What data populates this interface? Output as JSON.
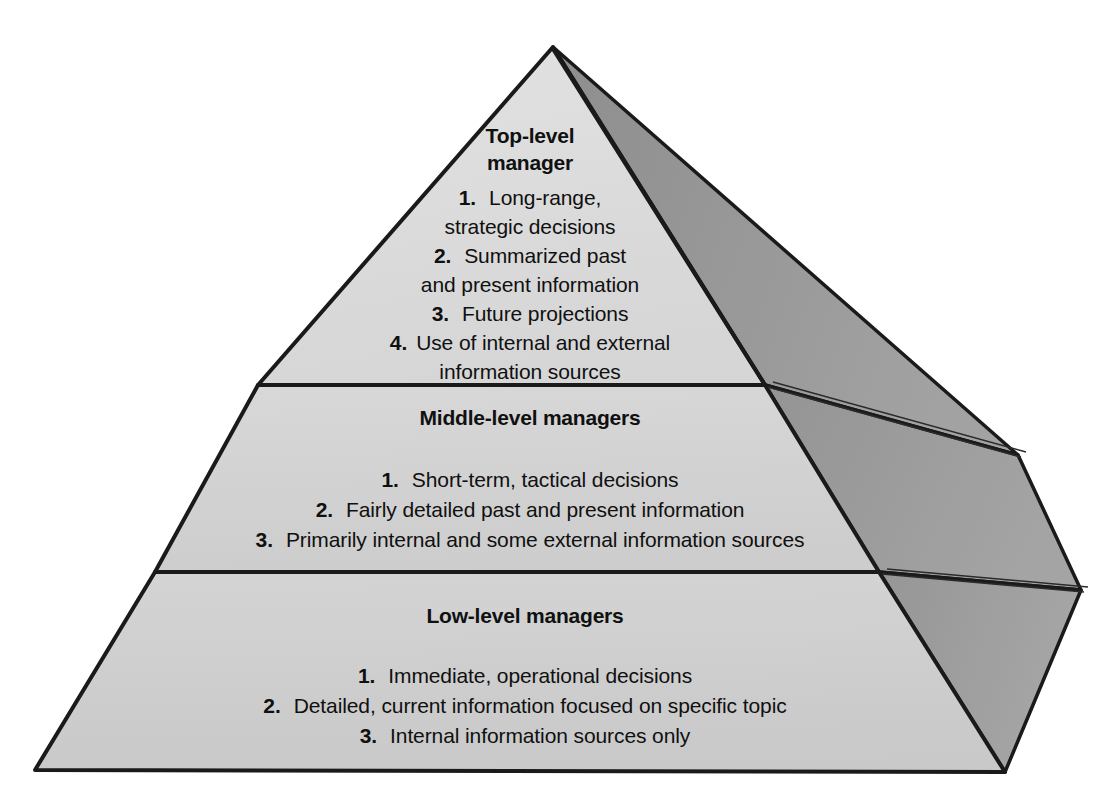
{
  "diagram": {
    "type": "3d-pyramid",
    "shape_name": "three-tier-pyramid",
    "colors": {
      "front_face_top": "#dcdcdc",
      "front_face_middle": "#d2d2d2",
      "front_face_bottom": "#cfcfcf",
      "side_face": "#9a9a9a",
      "side_face_upper": "#909090",
      "outline": "#1a1a1a",
      "text": "#101010",
      "background": "#ffffff"
    },
    "tiers": [
      {
        "id": "top",
        "heading_line_1": "Top-level",
        "heading_line_2": "manager",
        "items": [
          {
            "number": "1.",
            "lines": [
              "Long-range,",
              "strategic decisions"
            ]
          },
          {
            "number": "2.",
            "lines": [
              "Summarized past",
              "and  present information"
            ]
          },
          {
            "number": "3.",
            "lines": [
              "Future projections"
            ]
          },
          {
            "number": "4.",
            "lines": [
              "Use of internal and external",
              "information sources"
            ]
          }
        ]
      },
      {
        "id": "middle",
        "heading_line_1": "Middle-level managers",
        "heading_line_2": "",
        "items": [
          {
            "number": "1.",
            "lines": [
              "Short-term, tactical decisions"
            ]
          },
          {
            "number": "2.",
            "lines": [
              "Fairly detailed past and present  information"
            ]
          },
          {
            "number": "3.",
            "lines": [
              "Primarily internal and some external information sources"
            ]
          }
        ]
      },
      {
        "id": "bottom",
        "heading_line_1": "Low-level managers",
        "heading_line_2": "",
        "items": [
          {
            "number": "1.",
            "lines": [
              "Immediate, operational decisions"
            ]
          },
          {
            "number": "2.",
            "lines": [
              "Detailed, current information focused on specific topic"
            ]
          },
          {
            "number": "3.",
            "lines": [
              "Internal information sources only"
            ]
          }
        ]
      }
    ]
  },
  "top": {
    "heading1": "Top-level",
    "heading2": "manager",
    "n1": "1.",
    "l1a": "Long-range,",
    "l1b": "strategic decisions",
    "n2": "2.",
    "l2a": "Summarized past",
    "l2b": "and  present information",
    "n3": "3.",
    "l3a": "Future projections",
    "n4": "4.",
    "l4a": "Use of internal and external",
    "l4b": "information sources"
  },
  "middle": {
    "heading1": "Middle-level managers",
    "n1": "1.",
    "l1a": "Short-term, tactical decisions",
    "n2": "2.",
    "l2a": "Fairly detailed past and present  information",
    "n3": "3.",
    "l3a": "Primarily internal and some external information sources"
  },
  "bottom": {
    "heading1": "Low-level managers",
    "n1": "1.",
    "l1a": "Immediate, operational decisions",
    "n2": "2.",
    "l2a": "Detailed, current information focused on specific topic",
    "n3": "3.",
    "l3a": "Internal information sources only"
  }
}
